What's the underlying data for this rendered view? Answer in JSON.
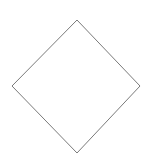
{
  "diagram": {
    "shapes": [
      {
        "type": "diamond",
        "role": "decision",
        "label": "",
        "points": {
          "top": [
            77,
            20
          ],
          "right": [
            140,
            86
          ],
          "bottom": [
            77,
            153
          ],
          "left": [
            12,
            86
          ]
        },
        "stroke": "#7a7a7a",
        "fill": "#ffffff"
      }
    ]
  }
}
